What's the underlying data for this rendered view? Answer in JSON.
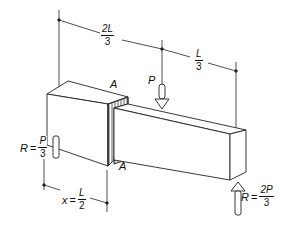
{
  "diagram": {
    "colors": {
      "line": "#222222",
      "fill": "#ffffff",
      "hatch": "#333333"
    },
    "dimensions": {
      "top_left": {
        "num": "2L",
        "den": "3"
      },
      "top_right": {
        "num": "L",
        "den": "3"
      },
      "bottom": {
        "lhs": "x",
        "equals": "=",
        "num": "L",
        "den": "2"
      }
    },
    "loads": {
      "applied": {
        "label": "P",
        "direction": "down"
      }
    },
    "reactions": {
      "left": {
        "lhs": "R",
        "equals": "=",
        "num": "P",
        "den": "3"
      },
      "right": {
        "lhs": "R",
        "equals": "=",
        "num": "2P",
        "den": "3"
      }
    },
    "section": {
      "label_top": "A",
      "label_bottom": "A"
    }
  }
}
